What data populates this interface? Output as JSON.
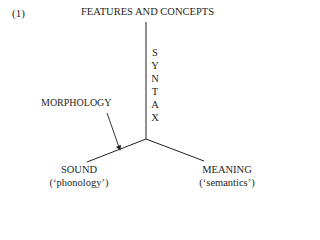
{
  "example_number": "(1)",
  "diagram": {
    "top_label": "FEATURES AND CONCEPTS",
    "vertical_axis_letters": [
      "S",
      "Y",
      "N",
      "T",
      "A",
      "X"
    ],
    "vertical_axis_label": "SYNTAX",
    "arrow_label": "MORPHOLOGY",
    "left": {
      "title": "SOUND",
      "subtitle": "(‘phonology’)"
    },
    "right": {
      "title": "MEANING",
      "subtitle": "(‘semantics’)"
    }
  }
}
